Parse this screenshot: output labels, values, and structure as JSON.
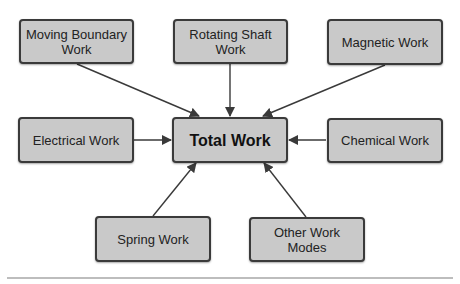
{
  "diagram": {
    "center": {
      "label": "Total Work"
    },
    "nodes": [
      {
        "id": "moving-boundary",
        "label": "Moving Boundary Work"
      },
      {
        "id": "rotating-shaft",
        "label": "Rotating Shaft Work"
      },
      {
        "id": "magnetic",
        "label": "Magnetic Work"
      },
      {
        "id": "electrical",
        "label": "Electrical Work"
      },
      {
        "id": "chemical",
        "label": "Chemical Work"
      },
      {
        "id": "spring",
        "label": "Spring Work"
      },
      {
        "id": "other",
        "label": "Other Work Modes"
      }
    ],
    "edges": [
      {
        "from": "moving-boundary",
        "to": "total-work"
      },
      {
        "from": "rotating-shaft",
        "to": "total-work"
      },
      {
        "from": "magnetic",
        "to": "total-work"
      },
      {
        "from": "electrical",
        "to": "total-work"
      },
      {
        "from": "chemical",
        "to": "total-work"
      },
      {
        "from": "spring",
        "to": "total-work"
      },
      {
        "from": "other",
        "to": "total-work"
      }
    ],
    "colors": {
      "node_fill": "#c9c9c9",
      "node_border": "#3a3a3a",
      "arrow": "#3a3a3a",
      "divider": "#bdbdbd"
    }
  }
}
